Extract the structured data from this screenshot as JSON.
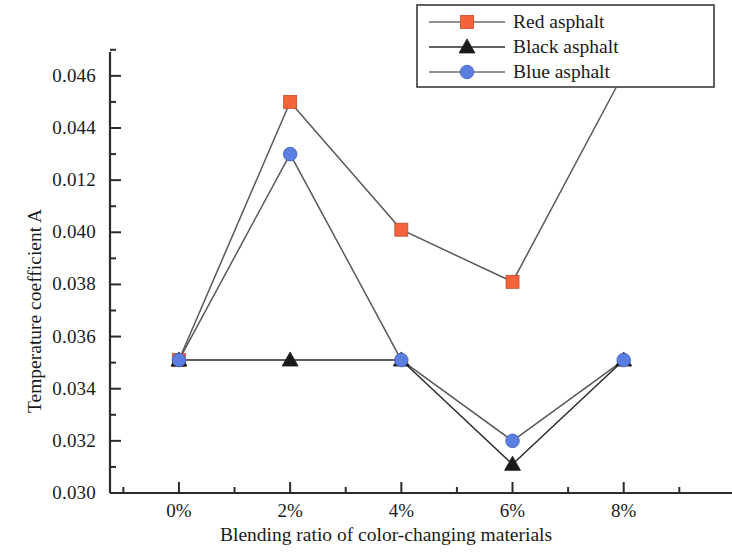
{
  "chart_data": {
    "type": "line",
    "title": "",
    "xlabel": "Blending ratio of color-changing materials",
    "ylabel": "Temperature coefficient A",
    "categories": [
      "0%",
      "2%",
      "4%",
      "6%",
      "8%"
    ],
    "x_tick_labels": [
      "0%",
      "2%",
      "4%",
      "6%",
      "8%"
    ],
    "y_tick_labels": [
      "0.030",
      "0.032",
      "0.034",
      "0.036",
      "0.038",
      "0.040",
      "0.012",
      "0.044",
      "0.046"
    ],
    "y_tick_values": [
      0.03,
      0.032,
      0.034,
      0.036,
      0.038,
      0.04,
      0.042,
      0.044,
      0.046
    ],
    "ylim": [
      0.03,
      0.0468
    ],
    "minor_ticks": true,
    "grid": false,
    "legend_position": "top-right",
    "series": [
      {
        "name": "Red asphalt",
        "color": "#f4643c",
        "marker": "square",
        "values": [
          0.0351,
          0.045,
          0.0401,
          0.0381,
          0.0461
        ]
      },
      {
        "name": "Black asphalt",
        "color": "#1a1a1a",
        "marker": "triangle",
        "values": [
          0.0351,
          0.0351,
          0.0351,
          0.0311,
          0.0351
        ]
      },
      {
        "name": "Blue asphalt",
        "color": "#5b7fe0",
        "marker": "circle",
        "values": [
          0.0351,
          0.043,
          0.0351,
          0.032,
          0.0351
        ]
      }
    ]
  },
  "legend": {
    "items": [
      {
        "label": "Red asphalt",
        "marker": "square",
        "color": "#f4643c"
      },
      {
        "label": "Black asphalt",
        "marker": "triangle",
        "color": "#1a1a1a"
      },
      {
        "label": "Blue asphalt",
        "marker": "circle",
        "color": "#5b7fe0"
      }
    ]
  },
  "axes": {
    "x_title": "Blending ratio of color-changing materials",
    "y_title": "Temperature coefficient A"
  }
}
